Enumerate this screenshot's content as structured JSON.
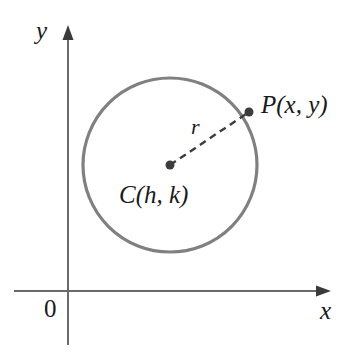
{
  "figure": {
    "kind": "geometry-diagram",
    "background_color": "#ffffff"
  },
  "axes": {
    "x_label": "x",
    "y_label": "y",
    "origin_label": "0",
    "axis_color": "#6a6a6a",
    "axis_stroke_width": 2,
    "x_axis": {
      "start_x": 14,
      "end_x": 330,
      "y": 291,
      "arrow": "right"
    },
    "y_axis": {
      "x": 68,
      "start_y": 345,
      "end_y": 27,
      "arrow": "up"
    }
  },
  "circle": {
    "center_x": 170,
    "center_y": 165,
    "radius": 87,
    "stroke_color": "#808080",
    "stroke_width": 3.2,
    "fill": "none"
  },
  "radius_line": {
    "label": "r",
    "from_x": 170,
    "from_y": 165,
    "to_x": 249,
    "to_y": 112,
    "stroke_color": "#3c3c3c",
    "stroke_width": 2.4,
    "dash_pattern": "7 5"
  },
  "points": [
    {
      "name": "center",
      "label": "C(h, k)",
      "x": 170,
      "y": 165,
      "dot_radius": 4.5,
      "dot_color": "#3c3c3c"
    },
    {
      "name": "point-p",
      "label": "P(x, y)",
      "x": 249,
      "y": 112,
      "dot_radius": 4.5,
      "dot_color": "#3c3c3c"
    }
  ],
  "chart_data": {
    "type": "scatter",
    "title": "",
    "xlabel": "x",
    "ylabel": "y",
    "annotations": [
      "0",
      "r",
      "C(h, k)",
      "P(x, y)"
    ],
    "shapes": [
      {
        "type": "circle",
        "center": [
          170,
          165
        ],
        "radius": 87,
        "label": "circle with center C(h, k) and radius r"
      },
      {
        "type": "segment",
        "from": [
          170,
          165
        ],
        "to": [
          249,
          112
        ],
        "style": "dashed",
        "label": "r"
      }
    ],
    "points": [
      {
        "label": "C(h, k)",
        "x": 170,
        "y": 165
      },
      {
        "label": "P(x, y)",
        "x": 249,
        "y": 112
      }
    ],
    "grid": false,
    "legend": "none"
  }
}
